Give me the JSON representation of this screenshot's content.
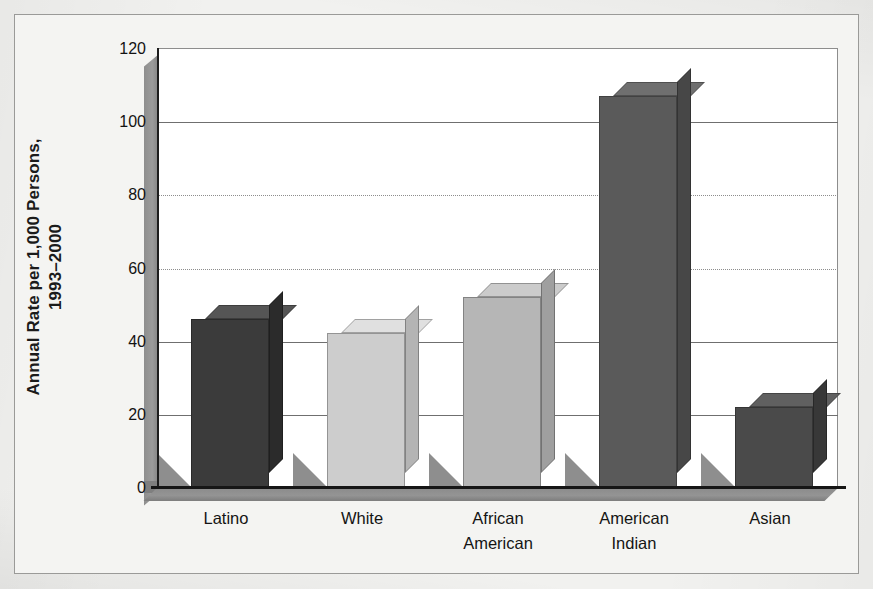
{
  "chart_data": {
    "type": "bar",
    "title": "",
    "subtitle": "",
    "xlabel": "",
    "ylabel": "Annual Rate per 1,000 Persons,\n1993–2000",
    "categories": [
      "Latino",
      "White",
      "African\nAmerican",
      "American\nIndian",
      "Asian"
    ],
    "values": [
      46,
      42,
      52,
      107,
      22
    ],
    "series": [
      {
        "name": "Annual Rate per 1,000 Persons, 1993–2000",
        "values": [
          46,
          42,
          52,
          107,
          22
        ]
      }
    ],
    "ylim": [
      0,
      120
    ],
    "ytick_labels": [
      "0",
      "20",
      "40",
      "60",
      "80",
      "100",
      "120"
    ],
    "ytick_values": [
      0,
      20,
      40,
      60,
      80,
      100,
      120
    ],
    "grid": true,
    "grid_axis": "y",
    "legend": "none",
    "style": "3d-bar",
    "bar_colors": [
      "#3b3b3b",
      "#cdcdcd",
      "#b6b6b6",
      "#5a5a5a",
      "#4a4a4a"
    ],
    "bar_top_colors": [
      "#555555",
      "#e0e0e0",
      "#cbcbcb",
      "#6f6f6f",
      "#606060"
    ],
    "bar_side_colors": [
      "#2b2b2b",
      "#b4b4b4",
      "#9f9f9f",
      "#474747",
      "#383838"
    ],
    "shadow_color": "#8e8e8e",
    "plot_background": "#ffffff",
    "figure_background": "#f1f1ef",
    "axis_color": "#161616",
    "gridline_color": "#6f6f6f"
  }
}
